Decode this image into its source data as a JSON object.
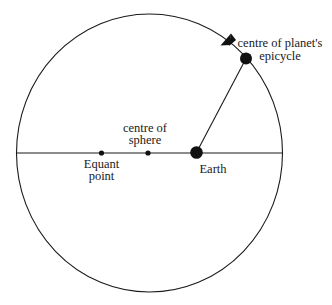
{
  "diagram": {
    "colors": {
      "stroke": "#1a1a1a",
      "background": "#ffffff"
    },
    "labels": {
      "epicycle_line1": "centre of planet's",
      "epicycle_line2": "epicycle",
      "sphere_line1": "centre of",
      "sphere_line2": "sphere",
      "equant_line1": "Equant",
      "equant_line2": "point",
      "earth": "Earth"
    },
    "points": [
      {
        "name": "Equant point",
        "x": 101.5,
        "y": 153
      },
      {
        "name": "centre of sphere",
        "x": 148,
        "y": 153
      },
      {
        "name": "Earth",
        "x": 196.5,
        "y": 152.5
      },
      {
        "name": "centre of planet's epicycle",
        "x": 246,
        "y": 58.5
      }
    ]
  }
}
